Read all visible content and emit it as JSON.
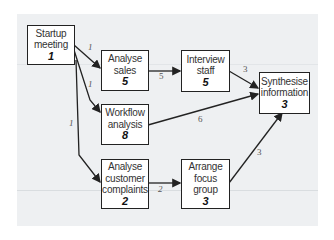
{
  "nodes": [
    {
      "id": "startup",
      "lines": [
        "Startup",
        "meeting"
      ],
      "duration": "1"
    },
    {
      "id": "sales",
      "lines": [
        "Analyse",
        "sales"
      ],
      "duration": "5"
    },
    {
      "id": "interview",
      "lines": [
        "Interview",
        "staff"
      ],
      "duration": "5"
    },
    {
      "id": "synth",
      "lines": [
        "Synthesise",
        "information"
      ],
      "duration": "3"
    },
    {
      "id": "workflow",
      "lines": [
        "Workflow",
        "analysis"
      ],
      "duration": "8"
    },
    {
      "id": "complaints",
      "lines": [
        "Analyse",
        "customer",
        "complaints"
      ],
      "duration": "2"
    },
    {
      "id": "focus",
      "lines": [
        "Arrange",
        "focus",
        "group"
      ],
      "duration": "3"
    }
  ],
  "edges": [
    {
      "from": "startup",
      "to": "sales",
      "label": "1"
    },
    {
      "from": "startup",
      "to": "workflow",
      "label": "1"
    },
    {
      "from": "startup",
      "to": "complaints",
      "label": "1"
    },
    {
      "from": "sales",
      "to": "interview",
      "label": "5"
    },
    {
      "from": "interview",
      "to": "synth",
      "label": "3"
    },
    {
      "from": "workflow",
      "to": "synth",
      "label": "6"
    },
    {
      "from": "complaints",
      "to": "focus",
      "label": "2"
    },
    {
      "from": "focus",
      "to": "synth",
      "label": "3"
    }
  ],
  "colors": {
    "background": "#edeff1",
    "box_border": "#222222",
    "arrow": "#222222"
  }
}
